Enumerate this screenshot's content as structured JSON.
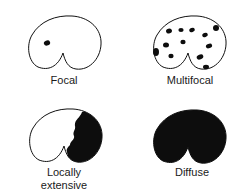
{
  "diagram": {
    "panels": [
      {
        "id": "focal",
        "label": "Focal",
        "fill": "none"
      },
      {
        "id": "multifocal",
        "label": "Multifocal",
        "fill": "scattered-spots"
      },
      {
        "id": "locally-extensive",
        "label_line1": "Locally",
        "label_line2": "extensive",
        "fill": "right-region"
      },
      {
        "id": "diffuse",
        "label": "Diffuse",
        "fill": "solid"
      }
    ],
    "colors": {
      "outline": "#111111",
      "lesion": "#0d0d0d",
      "background": "#ffffff"
    }
  }
}
